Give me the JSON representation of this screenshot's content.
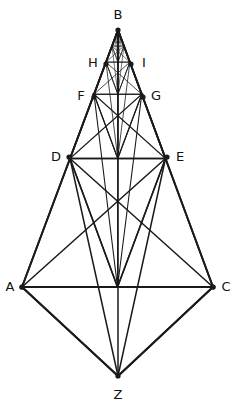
{
  "figure": {
    "canvas": {
      "width": 235,
      "height": 408
    },
    "background_color": "#ffffff",
    "line_color": "#1a1a1a",
    "label_color": "#111111"
  },
  "labels": {
    "A": "A",
    "B": "B",
    "C": "C",
    "D": "D",
    "E": "E",
    "F": "F",
    "G": "G",
    "H": "H",
    "I": "I",
    "Z": "Z"
  },
  "points": {
    "A": {
      "x": 22,
      "y": 287,
      "label": "A",
      "label_x": 10,
      "label_y": 287
    },
    "C": {
      "x": 213,
      "y": 287,
      "label": "C",
      "label_x": 226,
      "label_y": 287
    },
    "Z": {
      "x": 118,
      "y": 376,
      "label": "Z",
      "label_x": 118,
      "label_y": 395
    },
    "B": {
      "x": 118,
      "y": 30,
      "label": "B",
      "label_x": 118,
      "label_y": 15
    },
    "D": {
      "x": 69,
      "y": 157,
      "label": "D",
      "label_x": 56,
      "label_y": 157
    },
    "E": {
      "x": 167,
      "y": 157,
      "label": "E",
      "label_x": 180,
      "label_y": 157
    },
    "F": {
      "x": 94,
      "y": 97,
      "label": "F",
      "label_x": 81,
      "label_y": 96
    },
    "G": {
      "x": 143,
      "y": 97,
      "label": "G",
      "label_x": 156,
      "label_y": 96
    },
    "H": {
      "x": 106,
      "y": 64,
      "label": "H",
      "label_x": 93,
      "label_y": 63
    },
    "I": {
      "x": 131,
      "y": 64,
      "label": "I",
      "label_x": 144,
      "label_y": 63
    }
  },
  "construction": {
    "type": "recursive-kite",
    "levels": 6,
    "base_kite": [
      "A",
      "B",
      "C",
      "Z"
    ],
    "ladder_rungs": [
      [
        "A",
        "C"
      ],
      [
        "D",
        "E"
      ],
      [
        "F",
        "G"
      ],
      [
        "H",
        "I"
      ]
    ],
    "description": "Kite A-B-C-Z with nested self-similar sub-figures; each level halves toward apex B."
  },
  "stroke_widths": {
    "level_0": 1.9,
    "level_1": 1.5,
    "level_2": 1.1,
    "level_3": 0.8,
    "level_4": 0.6,
    "level_5": 0.45
  }
}
